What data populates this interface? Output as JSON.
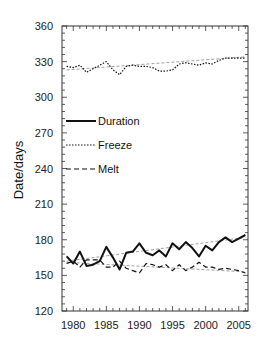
{
  "chart_data": {
    "type": "line",
    "title": "",
    "xlabel": "",
    "ylabel": "Date/days",
    "xlim": [
      1978.3,
      2006.4
    ],
    "ylim": [
      120,
      360
    ],
    "xticks": [
      1980,
      1985,
      1990,
      1995,
      2000,
      2005
    ],
    "yticks": [
      120,
      150,
      180,
      210,
      240,
      270,
      300,
      330,
      360
    ],
    "grid": false,
    "legend_position": "upper-left (inside, mid-height)",
    "x": [
      1979,
      1980,
      1981,
      1982,
      1983,
      1984,
      1985,
      1986,
      1987,
      1988,
      1989,
      1990,
      1991,
      1992,
      1993,
      1994,
      1995,
      1996,
      1997,
      1998,
      1999,
      2000,
      2001,
      2002,
      2003,
      2004,
      2005,
      2006
    ],
    "series": [
      {
        "name": "Duration",
        "style": "solid",
        "values": [
          166,
          160,
          170,
          158,
          159,
          162,
          174,
          165,
          155,
          169,
          170,
          177,
          169,
          167,
          171,
          166,
          177,
          172,
          178,
          173,
          166,
          175,
          171,
          178,
          182,
          178,
          181,
          184
        ],
        "trend": [
          162,
          182
        ]
      },
      {
        "name": "Freeze",
        "style": "dotted",
        "values": [
          326,
          325,
          327,
          321,
          324,
          327,
          330,
          323,
          319,
          326,
          327,
          326,
          326,
          325,
          322,
          322,
          323,
          328,
          329,
          328,
          327,
          329,
          328,
          331,
          333,
          333,
          333,
          333
        ],
        "trend": [
          323,
          334
        ]
      },
      {
        "name": "Melt",
        "style": "dashed",
        "values": [
          160,
          162,
          157,
          163,
          163,
          163,
          157,
          157,
          162,
          156,
          154,
          152,
          160,
          159,
          157,
          159,
          154,
          159,
          154,
          157,
          161,
          157,
          157,
          155,
          156,
          155,
          154,
          152
        ],
        "trend": [
          161,
          153
        ]
      }
    ]
  },
  "axes": {
    "y_title": "Date/days",
    "x_tick_labels": [
      "1980",
      "1985",
      "1990",
      "1995",
      "2000",
      "2005"
    ],
    "y_tick_labels": [
      "360",
      "330",
      "300",
      "270",
      "240",
      "210",
      "180",
      "150",
      "120"
    ]
  },
  "legend": {
    "items": [
      {
        "label": "Duration",
        "style": "solid"
      },
      {
        "label": "Freeze",
        "style": "dotted"
      },
      {
        "label": "Melt",
        "style": "dashed"
      }
    ]
  },
  "colors": {
    "line": "#111111",
    "trend": "#888888",
    "axis": "#333333"
  }
}
